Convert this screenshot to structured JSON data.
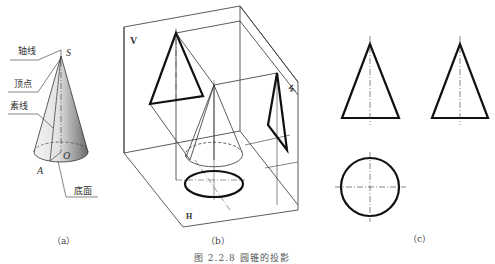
{
  "figure": {
    "caption": "图 2.2.8  圆锥的投影",
    "panels": [
      {
        "id": "a",
        "label": "（a）",
        "annotations": {
          "axis": "轴线",
          "apex": "顶点",
          "generatrix": "素线",
          "base": "底面",
          "apex_point": "S",
          "center_point": "O",
          "base_point": "A"
        }
      },
      {
        "id": "b",
        "label": "（b）",
        "planes": {
          "vertical": "V",
          "horizontal": "H",
          "side": "W"
        }
      },
      {
        "id": "c",
        "label": "（c）"
      }
    ]
  }
}
